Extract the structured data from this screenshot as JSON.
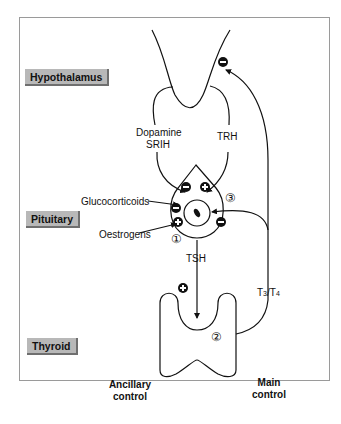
{
  "diagram": {
    "levels": {
      "hypothalamus": "Hypothalamus",
      "pituitary": "Pituitary",
      "thyroid": "Thyroid"
    },
    "hormones": {
      "dopamine": "Dopamine",
      "srih": "SRIH",
      "trh": "TRH",
      "tsh": "TSH",
      "t3": "T",
      "t3_sub": "3",
      "slash": "/",
      "t4": "T",
      "t4_sub": "4"
    },
    "modulators": {
      "glucocorticoids": "Glucocorticoids",
      "oestrogens": "Oestrogens"
    },
    "markers": {
      "one": "①",
      "two": "②",
      "three": "③"
    },
    "controls": {
      "ancillary_line1": "Ancillary",
      "ancillary_line2": "control",
      "main_line1": "Main",
      "main_line2": "control"
    },
    "signs": {
      "inhibit": "−",
      "stimulate": "+"
    },
    "colors": {
      "label_bg": "#b8b8b8",
      "line": "#111111",
      "frame": "#9a9a9a"
    }
  }
}
